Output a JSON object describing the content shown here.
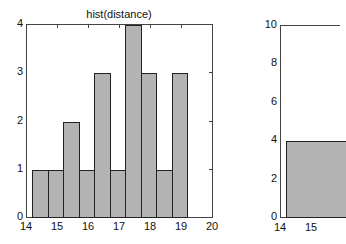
{
  "chart_data": [
    {
      "type": "bar",
      "title": "hist(distance)",
      "xlabel": "",
      "ylabel": "",
      "xlim": [
        14,
        20
      ],
      "ylim": [
        0,
        4
      ],
      "xticks": [
        "14",
        "15",
        "16",
        "17",
        "18",
        "19",
        "20"
      ],
      "yticks": [
        "0",
        "1",
        "2",
        "3",
        "4"
      ],
      "bin_edges": [
        14.2,
        14.7,
        15.2,
        15.7,
        16.2,
        16.7,
        17.2,
        17.7,
        18.2,
        18.7,
        19.2
      ],
      "values": [
        1,
        1,
        2,
        1,
        3,
        1,
        4,
        3,
        1,
        3
      ],
      "grid": false
    },
    {
      "type": "bar",
      "title": "",
      "xlabel": "",
      "ylabel": "",
      "xlim": [
        14,
        20
      ],
      "ylim": [
        0,
        10
      ],
      "xticks": [
        "14",
        "15"
      ],
      "yticks": [
        "0",
        "2",
        "4",
        "6",
        "8",
        "10"
      ],
      "values_visible": [
        4
      ],
      "note": "plot cropped at right edge",
      "grid": false
    }
  ]
}
